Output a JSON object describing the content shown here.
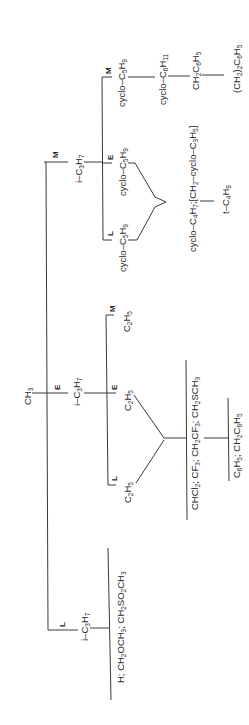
{
  "diagram": {
    "root": {
      "label": "CH3"
    },
    "branch_tags": {
      "L": "L",
      "E": "E",
      "M": "M"
    },
    "nodes": {
      "root_m_i_c3h7": "i-C3H7",
      "root_e_i_c3h7": "i-C3H7",
      "root_l_i_c3h7": "i-C3H7",
      "m_m_cyclo_c5h9": "cyclo-C5H9",
      "m_e_cyclo_c5h9": "cyclo-C5H9",
      "m_l_cyclo_c5h9": "cyclo-C5H9",
      "m_chain_cyclo_c6h11": "cyclo-C6H11",
      "m_chain_ch2c6h5": "CH2C6H5",
      "m_chain_ch22c6h5": "(CH2)2C6H5",
      "m_merge": "cyclo-C4H7;[CH2-cyclo-C3H5]",
      "m_merge_next": "t-C4H9",
      "e_m_c2h5": "C2H5",
      "e_e_c2h5": "C2H5",
      "e_l_c2h5": "C2H5",
      "e_merge": "CHCl2; CF3; CH2CF3; CH2SCH3",
      "e_merge_next": "C6H5; CH2C6H5",
      "l_list": "H; CH2OCH3; CH2SO2CH3"
    }
  }
}
